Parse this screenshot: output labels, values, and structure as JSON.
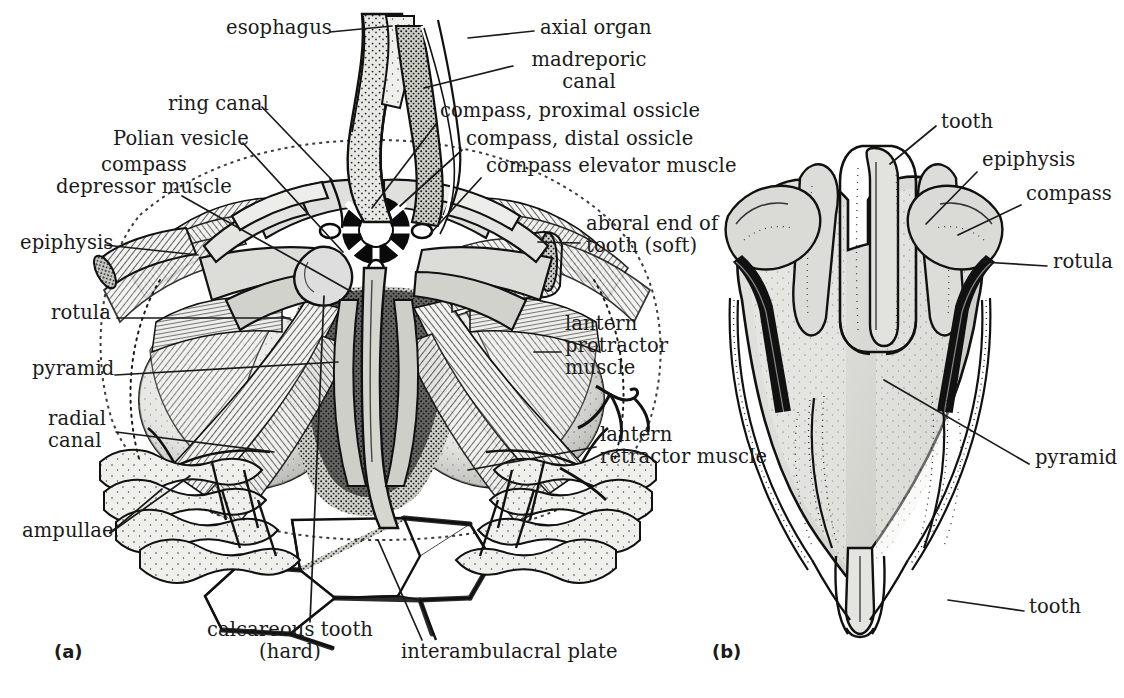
{
  "figure": {
    "background_color": "#ffffff",
    "ink_color": "#1a1a1a",
    "width": 1124,
    "height": 698
  },
  "panels": [
    {
      "id": "panel-a",
      "label": "(a)",
      "x": 54,
      "y": 648,
      "caption": "cutaway view of the lantern with associated muscles, canals and ampullae"
    },
    {
      "id": "panel-b",
      "label": "(b)",
      "x": 712,
      "y": 648,
      "caption": "intact lantern seen in lateral view"
    }
  ],
  "labels_a": [
    {
      "name": "esophagus",
      "text": "esophagus",
      "x": 226,
      "y": 25,
      "align": "left"
    },
    {
      "name": "ring-canal",
      "text": "ring canal",
      "x": 168,
      "y": 101,
      "align": "left"
    },
    {
      "name": "polian-vesicle",
      "text": "Polian vesicle",
      "x": 113,
      "y": 136,
      "align": "left"
    },
    {
      "name": "compass-depressor-muscle",
      "text": "compass\ndepressor muscle",
      "x": 4,
      "y": 162,
      "align": "left"
    },
    {
      "name": "epiphysis",
      "text": "epiphysis",
      "x": 20,
      "y": 240,
      "align": "left"
    },
    {
      "name": "rotula",
      "text": "rotula",
      "x": 51,
      "y": 310,
      "align": "left"
    },
    {
      "name": "pyramid",
      "text": "pyramid",
      "x": 32,
      "y": 366,
      "align": "left"
    },
    {
      "name": "radial-canal",
      "text": "radial\ncanal",
      "x": 48,
      "y": 415,
      "align": "left"
    },
    {
      "name": "ampullae",
      "text": "ampullae",
      "x": 22,
      "y": 528,
      "align": "left"
    },
    {
      "name": "calcareous-tooth",
      "text": "calcareous tooth\n(hard)",
      "x": 212,
      "y": 627,
      "align": "left"
    },
    {
      "name": "interambulacral-plate",
      "text": "interambulacral plate",
      "x": 401,
      "y": 648,
      "align": "left"
    },
    {
      "name": "axial-organ",
      "text": "axial organ",
      "x": 540,
      "y": 25,
      "align": "left"
    },
    {
      "name": "madreporic-canal",
      "text": "madreporic\ncanal",
      "x": 519,
      "y": 57,
      "align": "left"
    },
    {
      "name": "compass-proximal-ossicle",
      "text": "compass, proximal ossicle",
      "x": 440,
      "y": 108,
      "align": "left"
    },
    {
      "name": "compass-distal-ossicle",
      "text": "compass, distal ossicle",
      "x": 466,
      "y": 136,
      "align": "left"
    },
    {
      "name": "compass-elevator-muscle",
      "text": "compass elevator muscle",
      "x": 486,
      "y": 163,
      "align": "left"
    },
    {
      "name": "aboral-end-of-tooth-soft",
      "text": "aboral end of\ntooth (soft)",
      "x": 586,
      "y": 221,
      "align": "left"
    },
    {
      "name": "lantern-protractor-muscle",
      "text": "lantern\nprotractor\nmuscle",
      "x": 565,
      "y": 321,
      "align": "left"
    },
    {
      "name": "lantern-retractor-muscle",
      "text": "lantern\nretractor muscle",
      "x": 600,
      "y": 432,
      "align": "left"
    }
  ],
  "labels_b": [
    {
      "name": "tooth-aboral",
      "text": "tooth",
      "x": 941,
      "y": 119,
      "align": "left"
    },
    {
      "name": "epiphysis",
      "text": "epiphysis",
      "x": 982,
      "y": 157,
      "align": "left"
    },
    {
      "name": "compass",
      "text": "compass",
      "x": 1026,
      "y": 191,
      "align": "left"
    },
    {
      "name": "rotula",
      "text": "rotula",
      "x": 1053,
      "y": 259,
      "align": "left"
    },
    {
      "name": "pyramid",
      "text": "pyramid",
      "x": 1035,
      "y": 455,
      "align": "left"
    },
    {
      "name": "tooth-oral",
      "text": "tooth",
      "x": 1029,
      "y": 604,
      "align": "left"
    }
  ],
  "leader_lines_a": [
    {
      "name": "leader-esophagus",
      "points": "330,32 392,26"
    },
    {
      "name": "leader-axial-organ",
      "points": "534,31 468,38"
    },
    {
      "name": "leader-madreporic-canal",
      "points": "513,66 424,88"
    },
    {
      "name": "leader-ring-canal",
      "points": "262,107 330,178"
    },
    {
      "name": "leader-polian-vesicle",
      "points": "243,143 343,250"
    },
    {
      "name": "leader-compass-depressor-muscle",
      "points": "180,195 352,292"
    },
    {
      "name": "leader-epiphysis",
      "points": "105,245 196,254"
    },
    {
      "name": "leader-rotula",
      "points": "117,318 288,318"
    },
    {
      "name": "leader-pyramid",
      "points": "115,375 336,362"
    },
    {
      "name": "leader-radial-canal",
      "points": "116,432 272,452"
    },
    {
      "name": "leader-ampullae-1",
      "points": "108,533 160,490"
    },
    {
      "name": "leader-ampullae-2",
      "points": "108,533 186,478"
    },
    {
      "name": "leader-calcareous-tooth",
      "points": "310,622 322,295"
    },
    {
      "name": "leader-interambulacral-plate",
      "points": "420,640 378,540"
    },
    {
      "name": "leader-compass-proximal-ossicle",
      "points": "436,124 372,206"
    },
    {
      "name": "leader-compass-distal-ossicle",
      "points": "462,150 398,205"
    },
    {
      "name": "leader-compass-elevator-muscle",
      "points": "481,178 429,233"
    },
    {
      "name": "leader-aboral-end-of-tooth",
      "points": "578,243 540,240"
    },
    {
      "name": "leader-lantern-protractor",
      "points": "559,352 535,352"
    },
    {
      "name": "leader-lantern-retractor",
      "points": "594,447 470,470"
    }
  ],
  "leader_lines_b": [
    {
      "name": "leader-tooth-aboral",
      "points": "936,126 894,160"
    },
    {
      "name": "leader-epiphysis",
      "points": "977,172 928,222"
    },
    {
      "name": "leader-compass",
      "points": "1021,205 960,233"
    },
    {
      "name": "leader-rotula",
      "points": "1047,266 988,262"
    },
    {
      "name": "leader-pyramid",
      "points": "1029,464 888,381"
    },
    {
      "name": "leader-tooth-oral",
      "points": "1024,611 952,599"
    }
  ],
  "figure_notes": {
    "lantern_shading": "#d9d9d6",
    "lantern_shading_dark": "#9a9a95",
    "outline": "#111111"
  }
}
